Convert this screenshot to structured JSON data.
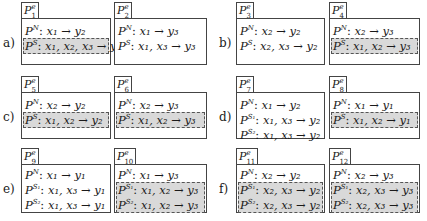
{
  "figure": {
    "rows": [
      {
        "label": "a)",
        "panels": [
          {
            "tab": {
              "base": "P",
              "sup": "e",
              "sub": "1"
            },
            "rules": [
              {
                "sup": "N",
                "lhs": "x₁",
                "rhs": "y₂",
                "highlighted": false
              },
              {
                "sup": "S",
                "lhs": "x₁, x₂, x₃",
                "rhs": "y₂",
                "highlighted": true
              }
            ]
          },
          {
            "tab": {
              "base": "P",
              "sup": "e",
              "sub": "2"
            },
            "rules": [
              {
                "sup": "N",
                "lhs": "x₁",
                "rhs": "y₃",
                "highlighted": false
              },
              {
                "sup": "S",
                "lhs": "x₁, x₃",
                "rhs": "y₃",
                "highlighted": false
              }
            ]
          }
        ]
      },
      {
        "label": "b)",
        "panels": [
          {
            "tab": {
              "base": "P",
              "sup": "e",
              "sub": "3"
            },
            "rules": [
              {
                "sup": "N",
                "lhs": "x₂",
                "rhs": "y₂",
                "highlighted": false
              },
              {
                "sup": "S",
                "lhs": "x₂, x₃",
                "rhs": "y₂",
                "highlighted": false
              }
            ]
          },
          {
            "tab": {
              "base": "P",
              "sup": "e",
              "sub": "4"
            },
            "rules": [
              {
                "sup": "N",
                "lhs": "x₂",
                "rhs": "y₃",
                "highlighted": false
              },
              {
                "sup": "S",
                "lhs": "x₁, x₂",
                "rhs": "y₃",
                "highlighted": true
              }
            ]
          }
        ]
      },
      {
        "label": "c)",
        "panels": [
          {
            "tab": {
              "base": "P",
              "sup": "e",
              "sub": "5"
            },
            "rules": [
              {
                "sup": "N",
                "lhs": "x₂",
                "rhs": "y₂",
                "highlighted": false
              },
              {
                "sup": "S",
                "lhs": "x₁, x₂",
                "rhs": "y₂",
                "highlighted": true
              }
            ]
          },
          {
            "tab": {
              "base": "P",
              "sup": "e",
              "sub": "6"
            },
            "rules": [
              {
                "sup": "N",
                "lhs": "x₂",
                "rhs": "y₃",
                "highlighted": false
              },
              {
                "sup": "S",
                "lhs": "x₁, x₂",
                "rhs": "y₃",
                "highlighted": true
              }
            ]
          }
        ]
      },
      {
        "label": "d)",
        "panels": [
          {
            "tab": {
              "base": "P",
              "sup": "e",
              "sub": "7"
            },
            "rules": [
              {
                "sup": "N",
                "lhs": "x₁",
                "rhs": "y₂",
                "highlighted": false
              },
              {
                "sup": "S₁",
                "lhs": "x₁, x₃",
                "rhs": "y₂",
                "highlighted": false
              },
              {
                "sup": "S₂",
                "lhs": "x₁, x₃",
                "rhs": "y₂",
                "highlighted": false
              }
            ]
          },
          {
            "tab": {
              "base": "P",
              "sup": "e",
              "sub": "8"
            },
            "rules": [
              {
                "sup": "N",
                "lhs": "x₁",
                "rhs": "y₁",
                "highlighted": false
              },
              {
                "sup": "S",
                "lhs": "x₁, x₂",
                "rhs": "y₁",
                "highlighted": true
              }
            ]
          }
        ]
      },
      {
        "label": "e)",
        "panels": [
          {
            "tab": {
              "base": "P",
              "sup": "e",
              "sub": "9"
            },
            "rules": [
              {
                "sup": "N",
                "lhs": "x₁",
                "rhs": "y₁",
                "highlighted": false
              },
              {
                "sup": "S₁",
                "lhs": "x₁, x₃",
                "rhs": "y₁",
                "highlighted": false
              },
              {
                "sup": "S₂",
                "lhs": "x₁, x₃",
                "rhs": "y₁",
                "highlighted": false
              }
            ]
          },
          {
            "tab": {
              "base": "P",
              "sup": "e",
              "sub": "10"
            },
            "rules": [
              {
                "sup": "N",
                "lhs": "x₁",
                "rhs": "y₃",
                "highlighted": false
              },
              {
                "sup": "S₁",
                "lhs": "x₁, x₂",
                "rhs": "y₃",
                "highlighted": true
              },
              {
                "sup": "S₂",
                "lhs": "x₁, x₂",
                "rhs": "y₃",
                "highlighted": true
              }
            ]
          }
        ]
      },
      {
        "label": "f)",
        "panels": [
          {
            "tab": {
              "base": "P",
              "sup": "e",
              "sub": "11"
            },
            "rules": [
              {
                "sup": "N",
                "lhs": "x₂",
                "rhs": "y₂",
                "highlighted": false
              },
              {
                "sup": "S₁",
                "lhs": "x₂, x₃",
                "rhs": "y₂",
                "highlighted": true
              },
              {
                "sup": "S₂",
                "lhs": "x₂, x₃",
                "rhs": "y₂",
                "highlighted": true
              }
            ]
          },
          {
            "tab": {
              "base": "P",
              "sup": "e",
              "sub": "12"
            },
            "rules": [
              {
                "sup": "N",
                "lhs": "x₂",
                "rhs": "y₃",
                "highlighted": false
              },
              {
                "sup": "S₁",
                "lhs": "x₂, x₃",
                "rhs": "y₃",
                "highlighted": true
              },
              {
                "sup": "S₂",
                "lhs": "x₂, x₃",
                "rhs": "y₃",
                "highlighted": true
              }
            ]
          }
        ]
      }
    ],
    "rule_base": "P",
    "rule_separator": ":",
    "arrow": "→",
    "colors": {
      "highlight": "#d9d9d9",
      "border": "#444444",
      "dash": "#555555"
    }
  }
}
